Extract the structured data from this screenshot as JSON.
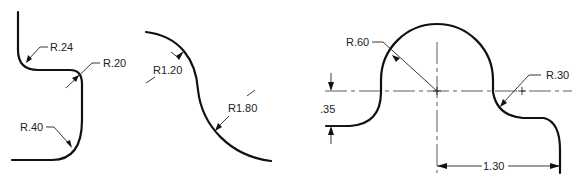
{
  "figures": [
    {
      "id": "fillet-profile",
      "labels": {
        "r1": "R.24",
        "r2": "R.20",
        "r3": "R.40"
      }
    },
    {
      "id": "reverse-curve",
      "labels": {
        "r1": "R1.20",
        "r2": "R1.80"
      }
    },
    {
      "id": "arc-profile",
      "labels": {
        "r_big": "R.60",
        "r_small": "R.30",
        "height": ".35",
        "width": "1.30"
      }
    }
  ],
  "colors": {
    "line": "#111111",
    "background": "#ffffff"
  }
}
